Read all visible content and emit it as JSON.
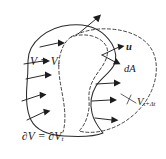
{
  "figure": {
    "caption_id": "material-volume-deformation",
    "background_color": "#ffffff",
    "line_color": "#2b2b2b",
    "dashed_color": "#3a3a3a",
    "arrow_color": "#1d1d1d",
    "width_px": 166,
    "height_px": 159
  },
  "labels": {
    "volume_current": {
      "text": "V = V",
      "subscript": "t",
      "full": "V = V_t",
      "meaning": "material-volume-at-time-t"
    },
    "boundary": {
      "prefix": "∂V = ∂V",
      "subscript": "t",
      "full": "∂V = ∂V_t",
      "meaning": "boundary-of-material-volume"
    },
    "velocity": {
      "text": "u",
      "full": "u",
      "meaning": "velocity-vector"
    },
    "area_element": {
      "text": "d",
      "vector": "A",
      "full": "dA",
      "meaning": "differential-area-element"
    },
    "volume_next": {
      "text": "V",
      "subscript": "t+Δt",
      "full": "V_{t+Δt}",
      "meaning": "material-volume-at-time-t-plus-delta-t"
    }
  },
  "geometry": {
    "solid_outline": {
      "name": "material-volume-boundary-at-t",
      "style": "solid",
      "path": "M 28 61 C 28 42 48 27 70 25 C 90 23 104 31 112 44 C 116 51 117 58 114 65 C 110 73 101 78 96 86 C 91 94 90 104 92 113 C 94 122 99 128 103 133 C 96 136 80 137 64 136 C 48 135 36 130 31 120 C 26 110 26 96 27 84 C 28 74 28 67 28 61 Z"
    },
    "dashed_outline": {
      "name": "material-volume-boundary-at-t-plus-dt",
      "style": "dashed",
      "path": "M 71 37 C 82 31 96 28 110 29 C 128 30 145 37 152 50 C 159 63 157 80 150 94 C 143 108 131 119 117 126 C 104 132 90 134 79 131 C 86 124 90 112 89 100 C 88 88 93 79 99 71 C 105 63 109 55 107 48 C 105 42 99 38 92 36 C 84 34 77 35 71 37 Z"
    },
    "inner_dashed_lobe": {
      "name": "swept-region-inner-edge",
      "style": "dashed",
      "path": "M 71 37 C 64 42 60 51 59 62 C 58 74 61 86 63 98 C 65 110 66 122 63 132"
    }
  },
  "arrows": {
    "left_field": [
      {
        "name": "velocity-arrow-left-1",
        "x1": 24,
        "y1": 64,
        "x2": 47,
        "y2": 60
      },
      {
        "name": "velocity-arrow-left-2",
        "x1": 26,
        "y1": 79,
        "x2": 49,
        "y2": 74
      },
      {
        "name": "velocity-arrow-left-3",
        "x1": 40,
        "y1": 47,
        "x2": 62,
        "y2": 42
      },
      {
        "name": "velocity-arrow-left-4",
        "x1": 22,
        "y1": 101,
        "x2": 43,
        "y2": 94
      },
      {
        "name": "velocity-arrow-left-5",
        "x1": 27,
        "y1": 120,
        "x2": 48,
        "y2": 110
      }
    ],
    "right_field": [
      {
        "name": "velocity-arrow-right-1",
        "x1": 96,
        "y1": 84,
        "x2": 119,
        "y2": 82
      },
      {
        "name": "velocity-arrow-right-2",
        "x1": 92,
        "y1": 101,
        "x2": 116,
        "y2": 99
      },
      {
        "name": "velocity-arrow-right-3",
        "x1": 95,
        "y1": 118,
        "x2": 117,
        "y2": 119
      }
    ],
    "top": {
      "name": "velocity-arrow-top",
      "x1": 78,
      "y1": 34,
      "x2": 101,
      "y2": 15
    },
    "normal": {
      "name": "velocity-vector-arrow-u",
      "x1": 102,
      "y1": 55,
      "x2": 124,
      "y2": 45
    },
    "area": {
      "name": "area-element-arrow-dA",
      "x1": 102,
      "y1": 55,
      "x2": 119,
      "y2": 65
    }
  },
  "leader_lines": [
    {
      "name": "leader-volume-next",
      "x1": 122,
      "y1": 97,
      "x2": 136,
      "y2": 102
    }
  ]
}
